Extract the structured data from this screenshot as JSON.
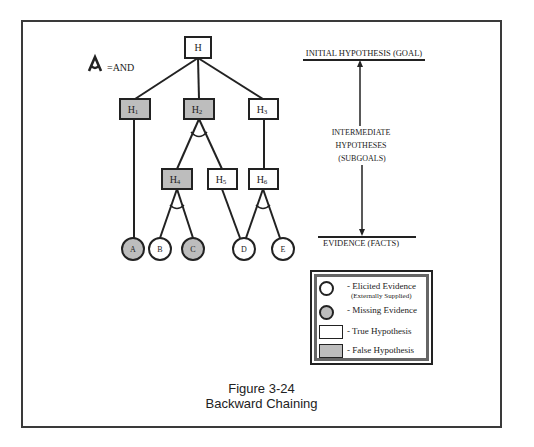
{
  "figure": {
    "number": "Figure 3-24",
    "title": "Backward Chaining"
  },
  "and_legend": {
    "symbol": "A",
    "label": "=AND"
  },
  "tree": {
    "root": {
      "id": "H",
      "label": "H",
      "state": "true"
    },
    "level1": [
      {
        "id": "H1",
        "label": "H",
        "sub": "1",
        "state": "false"
      },
      {
        "id": "H2",
        "label": "H",
        "sub": "2",
        "state": "false",
        "and": true
      },
      {
        "id": "H3",
        "label": "H",
        "sub": "3",
        "state": "true"
      }
    ],
    "level2": [
      {
        "id": "H4",
        "label": "H",
        "sub": "4",
        "state": "false",
        "parent": "H2",
        "and": true
      },
      {
        "id": "H5",
        "label": "H",
        "sub": "5",
        "state": "true",
        "parent": "H2"
      },
      {
        "id": "H6",
        "label": "H",
        "sub": "6",
        "state": "true",
        "parent": "H3",
        "and": true
      }
    ],
    "evidence": [
      {
        "id": "A",
        "label": "A",
        "state": "missing",
        "parent": "H1"
      },
      {
        "id": "B",
        "label": "B",
        "state": "elicited",
        "parent": "H4"
      },
      {
        "id": "C",
        "label": "C",
        "state": "missing",
        "parent": "H4"
      },
      {
        "id": "D",
        "label": "D",
        "state": "elicited",
        "parent": "H5,H6"
      },
      {
        "id": "E",
        "label": "E",
        "state": "elicited",
        "parent": "H6"
      }
    ]
  },
  "scale": {
    "top_label": "INITIAL HYPOTHESIS (GOAL)",
    "middle_label_lines": [
      "INTERMEDIATE",
      "HYPOTHESES",
      "(SUBGOALS)"
    ],
    "bottom_label": "EVIDENCE (FACTS)"
  },
  "legend": {
    "items": [
      {
        "symbol": "white-circle",
        "label": "- Elicited Evidence",
        "sublabel": "(Externally Supplied)"
      },
      {
        "symbol": "gray-circle",
        "label": "- Missing Evidence"
      },
      {
        "symbol": "white-rect",
        "label": "- True Hypothesis"
      },
      {
        "symbol": "gray-rect",
        "label": "- False Hypothesis"
      }
    ]
  },
  "colors": {
    "false_fill": "#bdbdbd",
    "true_fill": "#ffffff",
    "stroke": "#222222"
  }
}
